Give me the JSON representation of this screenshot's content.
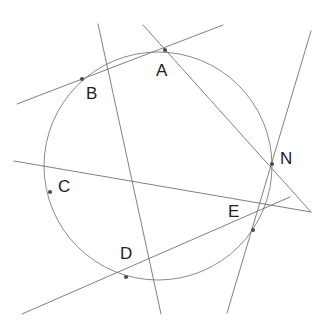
{
  "figure": {
    "width": 328,
    "height": 326,
    "background_color": "#ffffff",
    "line_color": "#6f7277",
    "circle_color": "#7a7d82",
    "point_color": "#4a4d52",
    "label_color": "#1d1d1f"
  },
  "circle": {
    "cx": 158,
    "cy": 166,
    "r": 114
  },
  "points": [
    {
      "id": "A",
      "label": "A",
      "x": 165,
      "y": 50,
      "label_x": 156,
      "label_y": 62
    },
    {
      "id": "B",
      "label": "B",
      "x": 82,
      "y": 79,
      "label_x": 86,
      "label_y": 85
    },
    {
      "id": "C",
      "label": "C",
      "x": 50,
      "y": 192,
      "label_x": 58,
      "label_y": 178
    },
    {
      "id": "D",
      "label": "D",
      "x": 126,
      "y": 277,
      "label_x": 120,
      "label_y": 245
    },
    {
      "id": "E",
      "label": "E",
      "x": 253,
      "y": 230,
      "label_x": 228,
      "label_y": 203
    },
    {
      "id": "N",
      "label": "N",
      "x": 272,
      "y": 164,
      "label_x": 280,
      "label_y": 150
    }
  ],
  "lines": [
    {
      "id": "line-BA",
      "through": "B-A",
      "x1": 17,
      "y1": 104,
      "x2": 223,
      "y2": 25
    },
    {
      "id": "line-BD",
      "through": "B-C-D",
      "x1": 98,
      "y1": 24,
      "x2": 161,
      "y2": 314
    },
    {
      "id": "line-AN",
      "through": "A-N",
      "x1": 143,
      "y1": 25,
      "x2": 311,
      "y2": 212
    },
    {
      "id": "line-CE",
      "through": "C-E",
      "x1": 14,
      "y1": 161,
      "x2": 311,
      "y2": 212
    },
    {
      "id": "line-EN",
      "through": "E-N",
      "x1": 227,
      "y1": 313,
      "x2": 311,
      "y2": 31
    },
    {
      "id": "line-CD",
      "through": "C-D",
      "x1": 22,
      "y1": 314,
      "x2": 290,
      "y2": 197
    }
  ]
}
